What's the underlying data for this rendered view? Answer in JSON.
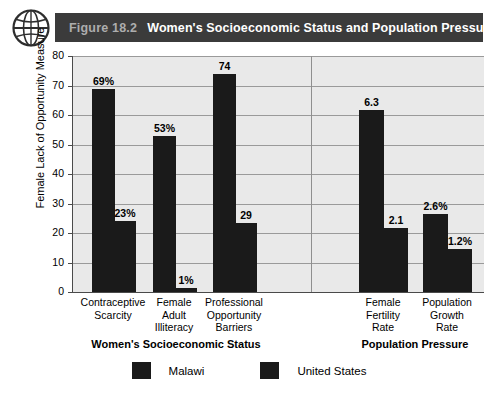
{
  "header": {
    "figure_number": "Figure 18.2",
    "title": "Women's Socioeconomic Status and Population Pressures",
    "band_color": "#3b3b3b",
    "figure_number_color": "#adadad",
    "title_color": "#ffffff",
    "icon": "globe-icon"
  },
  "chart_data": {
    "type": "bar",
    "title": "Women's Socioeconomic Status and Population Pressures",
    "xlabel": "",
    "ylabel": "Female Lack of Opportunity Measure",
    "ylim": [
      0,
      80
    ],
    "yticks": [
      0,
      10,
      20,
      30,
      40,
      50,
      60,
      70,
      80
    ],
    "ytick_labels": [
      "0",
      "10",
      "20",
      "30",
      "40",
      "50",
      "60",
      "70",
      "80"
    ],
    "grid": true,
    "legend_position": "bottom",
    "bar_color": "#1a1a1a",
    "plot_background": "#e9e9e9",
    "categories": [
      "Contraceptive Scarcity",
      "Female Adult Illiteracy",
      "Professional Opportunity Barriers",
      "Female Fertility Rate",
      "Population Growth Rate"
    ],
    "category_lines": [
      [
        "Contraceptive",
        "Scarcity"
      ],
      [
        "Female",
        "Adult",
        "Illiteracy"
      ],
      [
        "Professional",
        "Opportunity",
        "Barriers"
      ],
      [
        "Female",
        "Fertility",
        "Rate"
      ],
      [
        "Population",
        "Growth",
        "Rate"
      ]
    ],
    "series": [
      {
        "name": "Malawi",
        "color": "#1a1a1a",
        "values": [
          69,
          53,
          74,
          6.3,
          2.6
        ],
        "labels": [
          "69%",
          "53%",
          "74",
          "6.3",
          "2.6%"
        ]
      },
      {
        "name": "United States",
        "color": "#1a1a1a",
        "values": [
          23,
          1,
          29,
          2.1,
          1.2
        ],
        "labels": [
          "23%",
          "1%",
          "29",
          "2.1",
          "1.2%"
        ]
      }
    ],
    "panels": [
      {
        "label": "Women's Socioeconomic Status",
        "categories": [
          0,
          1,
          2
        ]
      },
      {
        "label": "Population Pressure",
        "categories": [
          3,
          4
        ]
      }
    ],
    "legend": [
      {
        "label": "Malawi",
        "color": "#1a1a1a"
      },
      {
        "label": "United States",
        "color": "#1a1a1a"
      }
    ]
  }
}
